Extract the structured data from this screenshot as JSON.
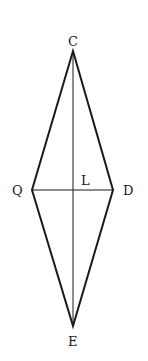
{
  "diagram": {
    "type": "rhombus-with-diagonals",
    "points": {
      "C": {
        "label": "C",
        "x": 73,
        "y": 51
      },
      "Q": {
        "label": "Q",
        "x": 32,
        "y": 190
      },
      "D": {
        "label": "D",
        "x": 113,
        "y": 190
      },
      "E": {
        "label": "E",
        "x": 73,
        "y": 326
      },
      "L": {
        "label": "L",
        "x": 73,
        "y": 190
      }
    },
    "edges": [
      [
        "C",
        "Q"
      ],
      [
        "C",
        "D"
      ],
      [
        "Q",
        "E"
      ],
      [
        "D",
        "E"
      ]
    ],
    "diagonals": [
      [
        "C",
        "E"
      ],
      [
        "Q",
        "D"
      ]
    ],
    "colors": {
      "stroke": "#1a1a1a",
      "background": "#ffffff"
    }
  }
}
